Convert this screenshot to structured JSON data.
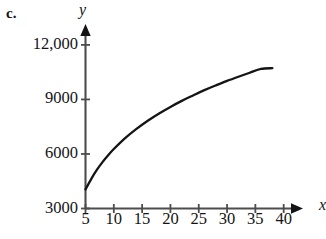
{
  "figure": {
    "part_label": "c.",
    "y_axis_name": "y",
    "x_axis_name": "x"
  },
  "chart_data": {
    "type": "line",
    "title": "",
    "subtitle": "",
    "xlabel": "x",
    "ylabel": "y",
    "grid": false,
    "legend": "none",
    "line_color": "#141414",
    "axis_color": "#4d4d4d",
    "xlim": [
      5,
      42
    ],
    "ylim": [
      3000,
      12600
    ],
    "x_ticks": [
      5,
      10,
      15,
      20,
      25,
      30,
      35,
      40
    ],
    "x_tick_labels": [
      "5",
      "10",
      "15",
      "20",
      "25",
      "30",
      "35",
      "40"
    ],
    "y_ticks": [
      3000,
      6000,
      9000,
      12000
    ],
    "y_tick_labels": [
      "3000",
      "6000",
      "9000",
      "12,000"
    ],
    "series": [
      {
        "name": "curve",
        "x": [
          5,
          6,
          7,
          8,
          9,
          10,
          12,
          14,
          16,
          18,
          20,
          22,
          24,
          26,
          28,
          30,
          32,
          34,
          36,
          38
        ],
        "y": [
          4050,
          4620,
          5120,
          5550,
          5930,
          6270,
          6870,
          7380,
          7830,
          8230,
          8590,
          8920,
          9220,
          9510,
          9770,
          10020,
          10250,
          10470,
          10680,
          10720
        ]
      }
    ]
  }
}
